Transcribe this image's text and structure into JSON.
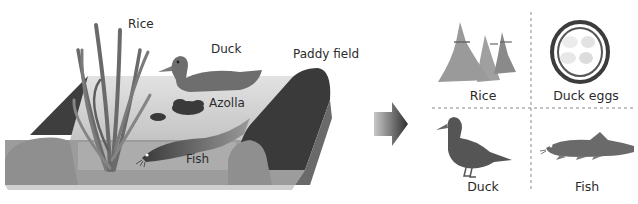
{
  "left_scene": {
    "labels": {
      "rice": "Rice",
      "duck": "Duck",
      "paddy_field": "Paddy field",
      "azolla": "Azolla",
      "fish": "Fish"
    }
  },
  "arrow": {
    "icon": "right-arrow-icon"
  },
  "outputs": {
    "items": [
      {
        "label": "Rice",
        "icon": "rice-sheaves-icon"
      },
      {
        "label": "Duck eggs",
        "icon": "nest-eggs-icon"
      },
      {
        "label": "Duck",
        "icon": "duck-icon"
      },
      {
        "label": "Fish",
        "icon": "fish-icon"
      }
    ]
  },
  "colors": {
    "ground": "#9a9a9a",
    "ridge": "#3c3c3c",
    "water": "#d6d6d6",
    "plant": "#6e6e6e",
    "text": "#2b2b2b"
  }
}
